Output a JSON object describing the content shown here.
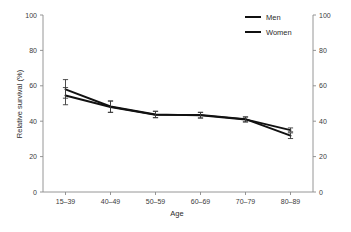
{
  "chart_data": {
    "type": "line",
    "title": "",
    "xlabel": "Age",
    "ylabel": "Relative survival (%)",
    "categories": [
      "15–39",
      "40–49",
      "50–59",
      "60–69",
      "70–79",
      "80–89"
    ],
    "ylim": [
      0,
      100
    ],
    "yticks": [
      0,
      20,
      40,
      60,
      80,
      100
    ],
    "ytick_labels": [
      "0",
      "20",
      "40",
      "60",
      "80",
      "100"
    ],
    "right_axis": {
      "ylim": [
        0,
        100
      ],
      "yticks": [
        0,
        20,
        40,
        60,
        80,
        100
      ],
      "ytick_labels": [
        "0",
        "20",
        "40",
        "60",
        "80",
        "100"
      ]
    },
    "grid": false,
    "legend_position": "top-right",
    "series": [
      {
        "name": "Men",
        "color": "#111111",
        "values": [
          58.0,
          48.3,
          43.8,
          43.3,
          41.0,
          35.0
        ],
        "err_low": [
          53.0,
          45.0,
          42.0,
          41.8,
          39.6,
          34.0
        ],
        "err_high": [
          63.5,
          51.4,
          45.6,
          45.0,
          42.4,
          36.2
        ]
      },
      {
        "name": "Women",
        "color": "#111111",
        "values": [
          54.5,
          48.0,
          43.6,
          43.6,
          41.2,
          31.8
        ],
        "err_low": [
          49.3,
          45.0,
          42.0,
          41.8,
          39.6,
          30.2
        ],
        "err_high": [
          59.0,
          51.4,
          45.6,
          45.0,
          42.4,
          33.4
        ]
      }
    ]
  },
  "legend": {
    "items": [
      {
        "label": "Men"
      },
      {
        "label": "Women"
      }
    ]
  },
  "axes": {
    "left_title": "Relative survival (%)",
    "bottom_title": "Age"
  }
}
